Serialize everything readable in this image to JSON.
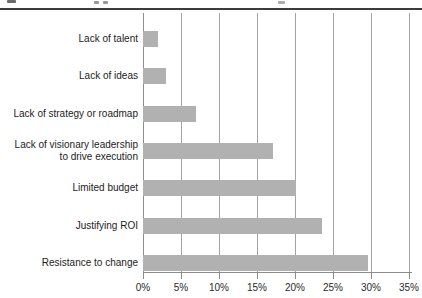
{
  "figure": {
    "cropped_caption_fragments_present": true
  },
  "chart_data": {
    "type": "bar",
    "orientation": "horizontal",
    "title": "",
    "xlabel": "",
    "ylabel": "",
    "categories": [
      "Lack of talent",
      "Lack of ideas",
      "Lack of strategy or roadmap",
      "Lack of visionary leadership\nto drive execution",
      "Limited budget",
      "Justifying ROI",
      "Resistance to change"
    ],
    "values": [
      2,
      3,
      7,
      17,
      20,
      23.5,
      29.5
    ],
    "xlim": [
      0,
      35
    ],
    "x_tick_labels": [
      "0%",
      "5%",
      "10%",
      "15%",
      "20%",
      "25%",
      "30%",
      "35%"
    ],
    "grid": "vertical",
    "legend": "none",
    "colors": {
      "bar": "#b1b1b1",
      "gridline": "#a3a3a3",
      "axis": "#8c8c8c",
      "text": "#1c1c1c",
      "top_rule": "#3c3c3c"
    }
  }
}
